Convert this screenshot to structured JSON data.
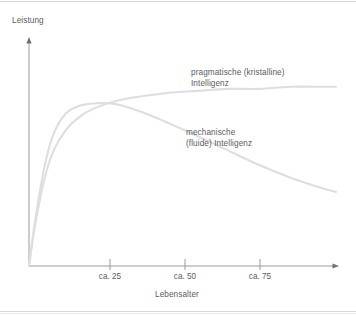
{
  "figure": {
    "width": 356,
    "height": 316,
    "background": "#ffffff",
    "border_color": "#c9c9cf"
  },
  "axes": {
    "y_title": "Leistung",
    "x_title": "Lebensalter",
    "axis_color": "#9a9aa0",
    "origin_x": 29,
    "origin_y": 266,
    "x_arrow_x": 338,
    "y_arrow_y": 38
  },
  "ticks": [
    {
      "label": "ca. 25",
      "x": 110
    },
    {
      "label": "ca. 50",
      "x": 185
    },
    {
      "label": "ca. 75",
      "x": 260
    }
  ],
  "series_labels": {
    "pragmatic_line1": "pragmatische (kristalline)",
    "pragmatic_line2": "Intelligenz",
    "mechanic_line1": "mechanische",
    "mechanic_line2": "(fluide) Intelligenz"
  },
  "curve_color": "#dcdee1",
  "chart_data": {
    "type": "line",
    "title": "",
    "subtitle": "",
    "xlabel": "Lebensalter",
    "ylabel": "Leistung",
    "xlim": [
      0,
      100
    ],
    "ylim": [
      0,
      100
    ],
    "grid": false,
    "legend": "inline-annotations",
    "xticks": [
      25,
      50,
      75
    ],
    "xticklabels": [
      "ca. 25",
      "ca. 50",
      "ca. 75"
    ],
    "yticks": [],
    "yticklabels": [],
    "annotations": [
      {
        "text": "pragmatische (kristalline) Intelligenz",
        "x": 52,
        "y": 74
      },
      {
        "text": "mechanische (fluide) Intelligenz",
        "x": 51,
        "y": 46
      }
    ],
    "series": [
      {
        "name": "pragmatische (kristalline) Intelligenz",
        "color": "#dcdee1",
        "x": [
          0,
          2,
          5,
          8,
          12,
          17,
          22,
          28,
          35,
          45,
          55,
          65,
          75,
          85,
          95,
          100
        ],
        "y": [
          0,
          20,
          42,
          56,
          66,
          73,
          77,
          80,
          82,
          84,
          85,
          86,
          86,
          87,
          87,
          87
        ]
      },
      {
        "name": "mechanische (fluide) Intelligenz",
        "color": "#dcdee1",
        "x": [
          0,
          2,
          5,
          8,
          12,
          17,
          22,
          26,
          30,
          38,
          46,
          55,
          65,
          75,
          85,
          95,
          100
        ],
        "y": [
          0,
          22,
          48,
          64,
          74,
          78,
          79,
          79,
          78,
          74,
          69,
          63,
          56,
          49,
          43,
          38,
          36
        ]
      }
    ]
  }
}
